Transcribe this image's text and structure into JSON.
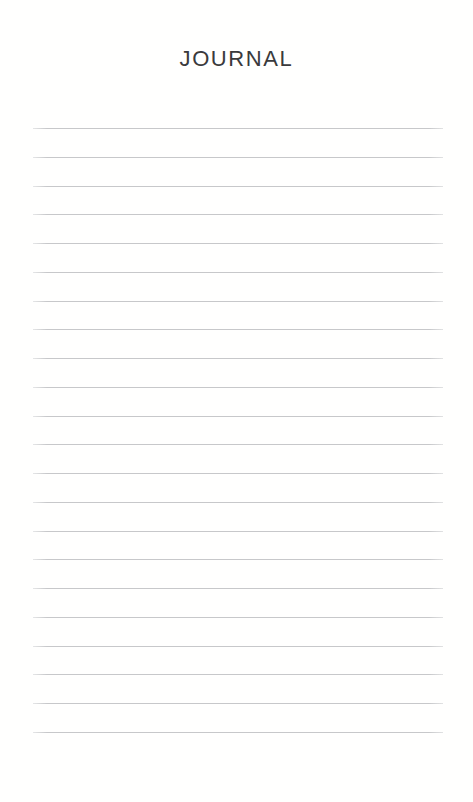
{
  "document": {
    "title": "JOURNAL",
    "background_color": "#fffffe",
    "page_width": 473,
    "page_height": 802
  },
  "header": {
    "title": "JOURNAL",
    "title_color": "#3a3a3c"
  },
  "ruled_area": {
    "line_color": "#c5c6c8",
    "line_count": 22,
    "first_line_y": 128,
    "last_line_y": 732,
    "line_spacing": 28.75,
    "line_left": 33,
    "line_right": 443,
    "lines": [
      {
        "index": 1,
        "text": ""
      },
      {
        "index": 2,
        "text": ""
      },
      {
        "index": 3,
        "text": ""
      },
      {
        "index": 4,
        "text": ""
      },
      {
        "index": 5,
        "text": ""
      },
      {
        "index": 6,
        "text": ""
      },
      {
        "index": 7,
        "text": ""
      },
      {
        "index": 8,
        "text": ""
      },
      {
        "index": 9,
        "text": ""
      },
      {
        "index": 10,
        "text": ""
      },
      {
        "index": 11,
        "text": ""
      },
      {
        "index": 12,
        "text": ""
      },
      {
        "index": 13,
        "text": ""
      },
      {
        "index": 14,
        "text": ""
      },
      {
        "index": 15,
        "text": ""
      },
      {
        "index": 16,
        "text": ""
      },
      {
        "index": 17,
        "text": ""
      },
      {
        "index": 18,
        "text": ""
      },
      {
        "index": 19,
        "text": ""
      },
      {
        "index": 20,
        "text": ""
      },
      {
        "index": 21,
        "text": ""
      },
      {
        "index": 22,
        "text": ""
      }
    ]
  }
}
